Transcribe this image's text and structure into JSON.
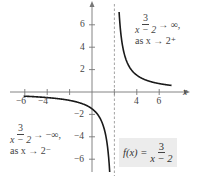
{
  "chart_data": {
    "type": "line",
    "title": "",
    "function": "f(x) = 3/(x-2)",
    "xlabel": "x",
    "ylabel": "y",
    "xlim": [
      -6.2,
      7.3
    ],
    "ylim": [
      -7.0,
      7.5
    ],
    "vertical_asymptote": 2,
    "horizontal_asymptote": 0,
    "x_ticks": [
      -6,
      -4,
      -2,
      2,
      4,
      6
    ],
    "x_tick_labels": [
      "−6",
      "−4",
      "4",
      "6"
    ],
    "y_ticks": [
      -6,
      -4,
      -2,
      2,
      4,
      6
    ],
    "y_tick_labels": [
      "−6",
      "−4",
      "−2",
      "2",
      "4",
      "6"
    ],
    "grid": false,
    "series": [
      {
        "name": "left branch",
        "x": [
          -6.1,
          -5,
          -4,
          -3,
          -2,
          -1,
          0,
          0.5,
          1,
          1.3,
          1.5,
          1.58
        ],
        "y": [
          -0.37,
          -0.43,
          -0.5,
          -0.6,
          -0.75,
          -1.0,
          -1.5,
          -2.0,
          -3.0,
          -4.29,
          -6.0,
          -7.1
        ]
      },
      {
        "name": "right branch",
        "x": [
          2.42,
          2.5,
          2.7,
          3,
          3.5,
          4,
          5,
          6,
          7.1
        ],
        "y": [
          7.1,
          6.0,
          4.29,
          3.0,
          2.0,
          1.5,
          1.0,
          0.75,
          0.59
        ]
      }
    ],
    "annotations": [
      {
        "text": "3/(x − 2) → ∞, as x → 2⁺",
        "position": "upper right"
      },
      {
        "text": "3/(x − 2) → −∞, as x → 2⁻",
        "position": "lower left"
      },
      {
        "text": "f(x) = 3/(x − 2)",
        "position": "lower right, shaded box"
      }
    ]
  },
  "axes": {
    "x_label": "x",
    "x_ticks": [
      {
        "value": -6,
        "label": "−6"
      },
      {
        "value": -4,
        "label": "−4"
      },
      {
        "value": 4,
        "label": "4"
      },
      {
        "value": 6,
        "label": "6"
      }
    ],
    "y_ticks": [
      {
        "value": 6,
        "label": "6"
      },
      {
        "value": 4,
        "label": "4"
      },
      {
        "value": 2,
        "label": "2"
      },
      {
        "value": -2,
        "label": "−2"
      },
      {
        "value": -4,
        "label": "−4"
      },
      {
        "value": -6,
        "label": "−6"
      }
    ]
  },
  "annotations": {
    "upper_right": {
      "num": "3",
      "den": "x − 2",
      "arrow": "→ ∞,",
      "line2": "as x → 2⁺"
    },
    "lower_left": {
      "num": "3",
      "den": "x − 2",
      "arrow": "→ −∞,",
      "line2": "as x → 2⁻"
    },
    "formula_box": {
      "lhs": "f(x) =",
      "num": "3",
      "den": "x − 2"
    }
  },
  "colors": {
    "curve": "#1a1a1a",
    "axis": "#777777",
    "asymptote": "#999999",
    "box": "#ececec"
  }
}
